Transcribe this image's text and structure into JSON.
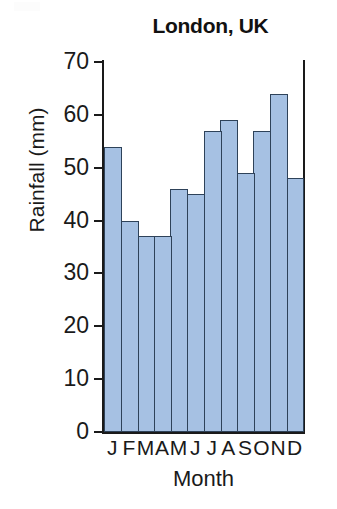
{
  "chart_data": {
    "type": "bar",
    "title": "London, UK",
    "xlabel": "Month",
    "ylabel": "Rainfall (mm)",
    "categories": [
      "J",
      "F",
      "M",
      "A",
      "M",
      "J",
      "J",
      "A",
      "S",
      "O",
      "N",
      "D"
    ],
    "values": [
      54,
      40,
      37,
      37,
      46,
      45,
      57,
      59,
      49,
      57,
      64,
      48
    ],
    "ylim": [
      0,
      70
    ],
    "ytick_labels": [
      "70",
      "60",
      "50",
      "40",
      "30",
      "20",
      "10",
      "0"
    ],
    "ytick_values": [
      70,
      60,
      50,
      40,
      30,
      20,
      10,
      0
    ],
    "grid": false,
    "legend": false,
    "bar_fill_color": "#a6c1e3",
    "bar_border_color": "#2e4259",
    "axis_color": "#1a1a1a",
    "background_color": "#ffffff"
  }
}
